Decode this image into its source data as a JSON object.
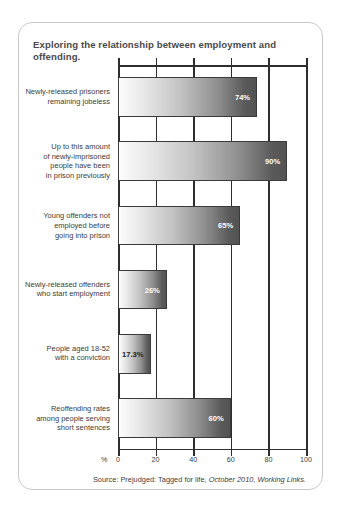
{
  "card": {
    "title": "Exploring the relationship between employment and offending.",
    "source_prefix": "Source: Prejudged: Tagged for life,",
    "source_italic": "October 2010, Working Links."
  },
  "axis": {
    "unit_symbol": "%",
    "ticks": [
      0,
      20,
      40,
      60,
      80,
      100
    ]
  },
  "chart_data": {
    "type": "bar",
    "orientation": "horizontal",
    "title": "Exploring the relationship between employment and offending.",
    "xlabel": "%",
    "ylabel": "",
    "xlim": [
      0,
      100
    ],
    "grid": true,
    "legend": null,
    "categories": [
      "Newly-released prisoners\nremaining jobeless",
      "Up to this amount\nof newly-imprisoned\npeople have been\nin prison previously",
      "Young offenders not\nemployed before\ngoing into prison",
      "Newly-released offenders\nwho start employment",
      "People aged 18-52\nwith a conviction",
      "Reoffending rates\namong people serving\nshort sentences"
    ],
    "values": [
      74,
      90,
      65,
      26,
      17.3,
      60
    ],
    "value_labels": [
      "74%",
      "90%",
      "65%",
      "26%",
      "17.3%",
      "60%"
    ],
    "tick_labels": [
      "0",
      "20",
      "40",
      "60",
      "80",
      "100"
    ]
  },
  "style": {
    "bar_gradient_start": "#fcfcfc",
    "bar_gradient_end": "#535353",
    "axis_color": "#2e2e2e",
    "text_color": "#3d3d3d",
    "title_color": "#4a4a4a",
    "card_border": "#c9c9c9"
  }
}
